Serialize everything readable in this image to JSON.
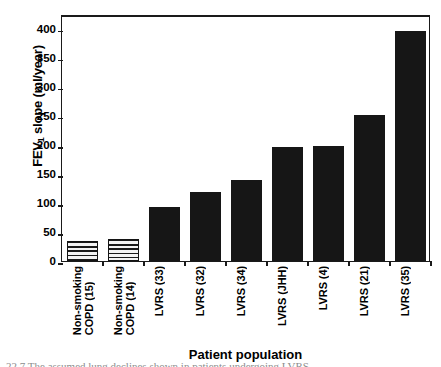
{
  "chart_data": {
    "type": "bar",
    "title": "",
    "xlabel": "Patient population",
    "ylabel": "FEV1 slope (ml/year)",
    "ylabel_main": "FEV",
    "ylabel_sub": "1",
    "ylabel_rest": " slope (ml/year)",
    "categories": [
      "Non-smoking COPD (15)",
      "Non-smoking COPD (14)",
      "LVRS (33)",
      "LVRS (32)",
      "LVRS (34)",
      "LVRS (JHH)",
      "LVRS (4)",
      "LVRS (21)",
      "LVRS (35)"
    ],
    "values": [
      35,
      38,
      93,
      119,
      139,
      197,
      198,
      251,
      396
    ],
    "ylim": [
      0,
      425
    ],
    "yticks": [
      0,
      50,
      100,
      150,
      200,
      250,
      300,
      350,
      400
    ],
    "ytick_labels": [
      "0",
      "50",
      "100",
      "150",
      "200",
      "250",
      "300",
      "350",
      "400"
    ],
    "grid": false,
    "legend": "none",
    "bar_styles": [
      "hatched",
      "hatched",
      "solid",
      "solid",
      "solid",
      "solid",
      "solid",
      "solid",
      "solid"
    ],
    "colors": {
      "bar_solid": "#161616",
      "bar_hatch_line": "#1a1a1a",
      "bar_hatch_fill": "#f4f4f4",
      "axis": "#1a1a1a",
      "text": "#000000",
      "background": "#ffffff"
    }
  },
  "caption": {
    "text": "22.7  The assumed lung declines shown in patients undergoing LVRS"
  }
}
